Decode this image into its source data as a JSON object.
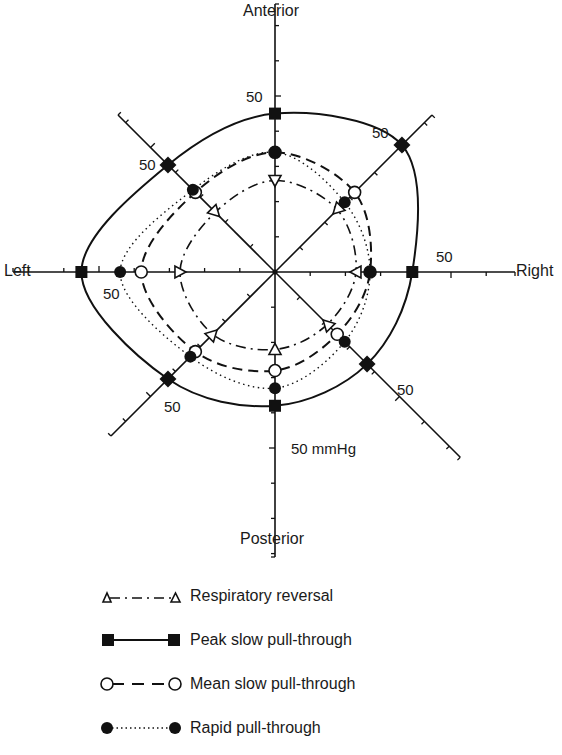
{
  "chart_data": {
    "type": "radar",
    "title": "",
    "units": "mmHg",
    "scale_label": "50 mmHg",
    "axis_max_tick": 50,
    "tick_step": 10,
    "axes": [
      "Anterior",
      "Anterior-Right",
      "Right",
      "Posterior-Right",
      "Posterior",
      "Posterior-Left",
      "Left",
      "Anterior-Left"
    ],
    "axis_labels": {
      "top": "Anterior",
      "bottom": "Posterior",
      "left": "Left",
      "right": "Right"
    },
    "tick_labels": [
      "50",
      "50",
      "50",
      "50",
      "50",
      "50",
      "50 mmHg",
      "50"
    ],
    "series": [
      {
        "name": "Respiratory reversal",
        "marker": "open-triangle",
        "line": "dash-dot",
        "values": [
          26,
          25,
          23,
          21,
          22,
          25,
          27,
          24
        ]
      },
      {
        "name": "Peak slow pull-through",
        "marker": "filled-square",
        "line": "solid",
        "values": [
          45,
          51,
          39,
          37,
          38,
          43,
          55,
          43
        ]
      },
      {
        "name": "Mean slow pull-through",
        "marker": "open-circle",
        "line": "dashed",
        "values": [
          34,
          32,
          27,
          25,
          28,
          32,
          38,
          32
        ]
      },
      {
        "name": "Rapid pull-through",
        "marker": "filled-circle",
        "line": "dotted",
        "values": [
          34,
          28,
          27,
          28,
          33,
          34,
          44,
          33
        ]
      }
    ],
    "legend_position": "bottom",
    "grid": false
  },
  "legend": {
    "items": [
      {
        "label": "Respiratory reversal"
      },
      {
        "label": "Peak slow pull-through"
      },
      {
        "label": "Mean slow pull-through"
      },
      {
        "label": "Rapid pull-through"
      }
    ]
  },
  "labels": {
    "anterior": "Anterior",
    "posterior": "Posterior",
    "left": "Left",
    "right": "Right",
    "fifty": "50",
    "fifty_mmhg": "50 mmHg"
  }
}
